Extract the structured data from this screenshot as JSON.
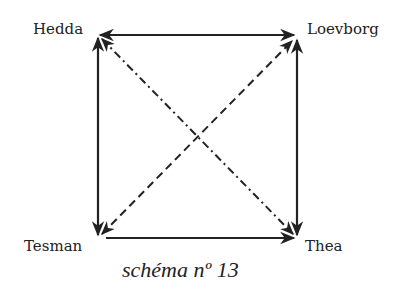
{
  "diagram": {
    "nodes": [
      {
        "id": "hedda",
        "label": "Hedda",
        "x": 98,
        "y": 35
      },
      {
        "id": "loevborg",
        "label": "Loevborg",
        "x": 296,
        "y": 35
      },
      {
        "id": "tesman",
        "label": "Tesman",
        "x": 98,
        "y": 238
      },
      {
        "id": "thea",
        "label": "Thea",
        "x": 297,
        "y": 238
      }
    ],
    "edges": [
      {
        "from": "hedda",
        "to": "loevborg",
        "style": "solid",
        "arrows": "both"
      },
      {
        "from": "hedda",
        "to": "tesman",
        "style": "solid",
        "arrows": "both"
      },
      {
        "from": "loevborg",
        "to": "thea",
        "style": "solid",
        "arrows": "both"
      },
      {
        "from": "tesman",
        "to": "thea",
        "style": "solid",
        "arrows": "end"
      },
      {
        "from": "hedda",
        "to": "thea",
        "style": "dash-dot",
        "arrows": "both"
      },
      {
        "from": "tesman",
        "to": "loevborg",
        "style": "dashed",
        "arrows": "both"
      }
    ],
    "caption": "schéma nº 13",
    "colors": {
      "ink": "#222222",
      "background": "#ffffff"
    }
  }
}
